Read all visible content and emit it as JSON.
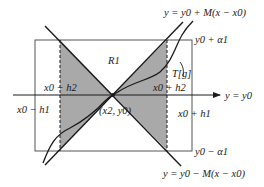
{
  "diagram": {
    "labels": {
      "line_upper": "y = y0 + M(x − x0)",
      "line_lower": "y = y0 − M(x − x0)",
      "region": "R1",
      "top_bound": "y0 + α1",
      "bottom_bound": "y0 − α1",
      "curve": "T[g]",
      "left_inner": "x0 − h2",
      "right_inner": "x0 + h2",
      "left_outer": "x0 − h1",
      "right_outer": "x0 + h1",
      "axis": "y = y0",
      "point": "(x2, y0)"
    },
    "colors": {
      "shade": "#a9a9a9",
      "line": "#1a1a1a",
      "rect": "#555555",
      "background": "#ffffff"
    },
    "geometry": {
      "rect": {
        "x1": 35,
        "y1": 40,
        "x2": 192,
        "y2": 151
      },
      "axis_y": 95,
      "center": {
        "x": 113,
        "y": 95
      },
      "inner_left_x": 60,
      "inner_right_x": 167
    }
  }
}
